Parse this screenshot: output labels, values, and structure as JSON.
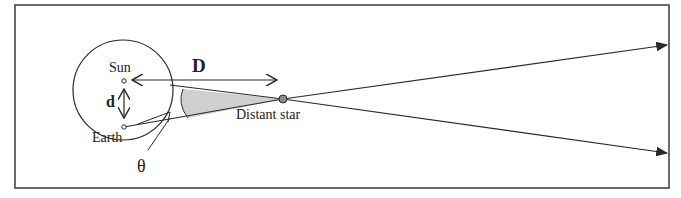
{
  "diagram": {
    "labels": {
      "sun": "Sun",
      "earth": "Earth",
      "distance_major": "D",
      "distance_minor": "d",
      "angle": "θ",
      "star": "Distant star"
    },
    "colors": {
      "stroke": "#2a2a2a",
      "wedge_fill": "#cfcfcf",
      "star_fill": "#8c8c8c",
      "frame": "#3a3a3a",
      "background": "#ffffff"
    }
  }
}
